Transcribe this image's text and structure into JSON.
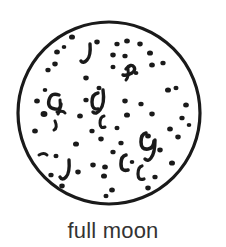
{
  "figure": {
    "name": "full-moon-diagram",
    "caption": "full moon",
    "background_color": "#ffffff",
    "ink_color": "#1a1a1a",
    "caption_color": "#333333"
  },
  "moon": {
    "label": "moon disc",
    "outline": {
      "center_x": 109,
      "center_y": 113,
      "radius": 91,
      "stroke_color": "#1a1a1a",
      "stroke_width": 3.2,
      "fill_color": "#ffffff",
      "style": "hand-drawn"
    },
    "surface_marks_count": 72,
    "dots": [
      {
        "cx": 72,
        "cy": 37,
        "r": 2.6
      },
      {
        "cx": 97,
        "cy": 42,
        "r": 2.4
      },
      {
        "cx": 117,
        "cy": 44,
        "r": 2.3
      },
      {
        "cx": 127,
        "cy": 41,
        "r": 2.5
      },
      {
        "cx": 140,
        "cy": 44,
        "r": 2.4
      },
      {
        "cx": 57,
        "cy": 52,
        "r": 2.5
      },
      {
        "cx": 113,
        "cy": 55,
        "r": 2.4
      },
      {
        "cx": 125,
        "cy": 56,
        "r": 2.3
      },
      {
        "cx": 150,
        "cy": 53,
        "r": 2.6
      },
      {
        "cx": 55,
        "cy": 64,
        "r": 2.4
      },
      {
        "cx": 48,
        "cy": 70,
        "r": 2.3
      },
      {
        "cx": 113,
        "cy": 67,
        "r": 2.2
      },
      {
        "cx": 152,
        "cy": 65,
        "r": 2.5
      },
      {
        "cx": 163,
        "cy": 63,
        "r": 2.3
      },
      {
        "cx": 86,
        "cy": 78,
        "r": 2.4
      },
      {
        "cx": 99,
        "cy": 88,
        "r": 2.2
      },
      {
        "cx": 168,
        "cy": 90,
        "r": 2.6
      },
      {
        "cx": 176,
        "cy": 88,
        "r": 2.2
      },
      {
        "cx": 37,
        "cy": 101,
        "r": 2.5
      },
      {
        "cx": 86,
        "cy": 100,
        "r": 2.3
      },
      {
        "cx": 125,
        "cy": 101,
        "r": 2.4
      },
      {
        "cx": 141,
        "cy": 104,
        "r": 2.3
      },
      {
        "cx": 186,
        "cy": 105,
        "r": 2.5
      },
      {
        "cx": 44,
        "cy": 114,
        "r": 3.0
      },
      {
        "cx": 80,
        "cy": 116,
        "r": 2.5
      },
      {
        "cx": 127,
        "cy": 115,
        "r": 2.6
      },
      {
        "cx": 152,
        "cy": 114,
        "r": 2.4
      },
      {
        "cx": 182,
        "cy": 118,
        "r": 2.3
      },
      {
        "cx": 35,
        "cy": 131,
        "r": 2.5
      },
      {
        "cx": 92,
        "cy": 131,
        "r": 2.3
      },
      {
        "cx": 117,
        "cy": 128,
        "r": 2.2
      },
      {
        "cx": 170,
        "cy": 129,
        "r": 2.5
      },
      {
        "cx": 178,
        "cy": 137,
        "r": 2.4
      },
      {
        "cx": 76,
        "cy": 144,
        "r": 2.6
      },
      {
        "cx": 101,
        "cy": 139,
        "r": 2.4
      },
      {
        "cx": 121,
        "cy": 143,
        "r": 2.3
      },
      {
        "cx": 148,
        "cy": 136,
        "r": 2.5
      },
      {
        "cx": 160,
        "cy": 150,
        "r": 2.4
      },
      {
        "cx": 56,
        "cy": 156,
        "r": 2.2
      },
      {
        "cx": 113,
        "cy": 152,
        "r": 2.3
      },
      {
        "cx": 93,
        "cy": 165,
        "r": 2.4
      },
      {
        "cx": 105,
        "cy": 167,
        "r": 2.5
      },
      {
        "cx": 172,
        "cy": 163,
        "r": 2.6
      },
      {
        "cx": 51,
        "cy": 175,
        "r": 2.3
      },
      {
        "cx": 78,
        "cy": 172,
        "r": 2.4
      },
      {
        "cx": 104,
        "cy": 176,
        "r": 2.6
      },
      {
        "cx": 155,
        "cy": 177,
        "r": 2.3
      },
      {
        "cx": 62,
        "cy": 186,
        "r": 2.4
      },
      {
        "cx": 112,
        "cy": 190,
        "r": 2.5
      },
      {
        "cx": 148,
        "cy": 188,
        "r": 2.4
      },
      {
        "cx": 106,
        "cy": 196,
        "r": 2.2
      },
      {
        "cx": 64,
        "cy": 47,
        "r": 2.0
      },
      {
        "cx": 136,
        "cy": 73,
        "r": 2.1
      },
      {
        "cx": 45,
        "cy": 90,
        "r": 2.0
      },
      {
        "cx": 189,
        "cy": 125,
        "r": 2.0
      },
      {
        "cx": 132,
        "cy": 162,
        "r": 2.0
      }
    ],
    "craters": [
      {
        "path": "M 90 44 q 1 12 -3 16 q -4 4 -6 1",
        "w": 3.4
      },
      {
        "path": "M 59 95 q -8 -3 -10 5 q -2 8 6 9 q 6 1 6 -5",
        "w": 3.4
      },
      {
        "path": "M 60 100 q 1 10 -2 14",
        "w": 3.0
      },
      {
        "path": "M 55 121 q 3 7 -1 9",
        "w": 3.0
      },
      {
        "path": "M 98 93 q -6 1 -6 9 q 0 8 6 7",
        "w": 3.4
      },
      {
        "path": "M 103 90 q 2 14 -3 20 q -4 5 -7 2",
        "w": 3.4
      },
      {
        "path": "M 104 116 q -4 1 -4 7 q 0 6 5 4",
        "w": 3.0
      },
      {
        "path": "M 126 69 q 5 -6 8 -2 q 2 3 -2 6 q -5 3 -9 2",
        "w": 3.4
      },
      {
        "path": "M 128 69 q 1 8 -2 11",
        "w": 3.0
      },
      {
        "path": "M 146 133 q -5 1 -5 9 q 0 8 7 7 q 6 -1 6 -8",
        "w": 3.6
      },
      {
        "path": "M 155 140 q 0 13 -4 18 q -3 4 -6 1",
        "w": 3.4
      },
      {
        "path": "M 126 155 q -5 1 -5 9 q 0 8 7 6",
        "w": 3.6
      },
      {
        "path": "M 142 166 q -4 1 -4 8 q 0 7 6 5",
        "w": 3.2
      },
      {
        "path": "M 69 160 q 1 13 -3 17 q -4 4 -6 0",
        "w": 3.4
      },
      {
        "path": "M 39 155 q 5 -3 8 0",
        "w": 3.0
      },
      {
        "path": "M 57 112 q 6 -2 8 1",
        "w": 3.0
      }
    ]
  }
}
